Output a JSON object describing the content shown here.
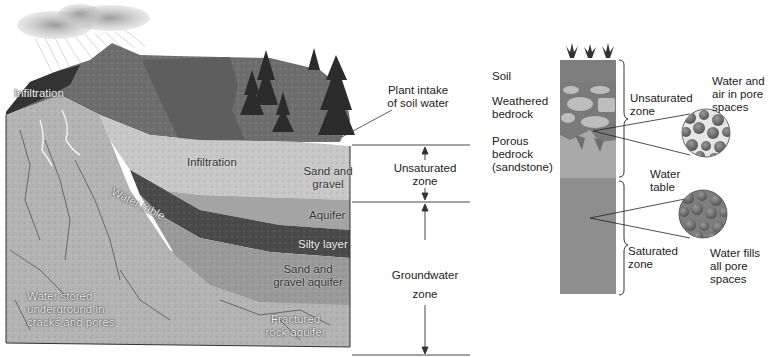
{
  "diagram": {
    "type": "groundwater cross-section",
    "colors": {
      "background": "#ffffff",
      "sky_cloud": "#b8b8b8",
      "lake": "#5e5e5e",
      "vegetation_terrain": "#7d7d7d",
      "unsaturated_sand_gravel": "#c8c8c8",
      "aquifer": "#a4a4a4",
      "silty_layer": "#4a4a4a",
      "sand_gravel_aquifer": "#9a9a9a",
      "fractured_rock": "#b4b4b4",
      "column_soil": "#8a8a8a",
      "column_unsaturated": "#a9a9a9",
      "column_saturated": "#8e8e8e"
    },
    "left_panel": {
      "labels": {
        "infiltration_top": "Infiltration",
        "infiltration_mid": "Infiltration",
        "plant_intake": [
          "Plant intake",
          "of soil water"
        ],
        "sand_and_gravel": [
          "Sand and",
          "gravel"
        ],
        "water_table": "Water table",
        "aquifer": "Aquifer",
        "silty_layer": "Silty layer",
        "sand_gravel_aquifer": [
          "Sand and",
          "gravel aquifer"
        ],
        "water_stored": [
          "Water stored",
          "underground in",
          "cracks and pores"
        ],
        "fractured_rock_aquifer": [
          "Fractured",
          "rock aquifer"
        ]
      },
      "zones": {
        "unsaturated": [
          "Unsaturated",
          "zone"
        ],
        "groundwater": [
          "Groundwater",
          "zone"
        ]
      }
    },
    "right_panel": {
      "layer_labels": {
        "soil": "Soil",
        "weathered_bedrock": [
          "Weathered",
          "bedrock"
        ],
        "porous_bedrock": [
          "Porous",
          "bedrock",
          "(sandstone)"
        ]
      },
      "zones": {
        "unsaturated": [
          "Unsaturated",
          "zone"
        ],
        "water_table": [
          "Water",
          "table"
        ],
        "saturated": [
          "Saturated",
          "zone"
        ]
      },
      "callouts": {
        "top": [
          "Water and",
          "air in pore",
          "spaces"
        ],
        "bottom": [
          "Water fills",
          "all pore",
          "spaces"
        ]
      }
    }
  }
}
